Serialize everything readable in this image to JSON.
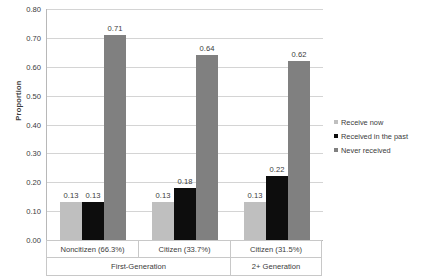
{
  "chart_data": {
    "type": "bar",
    "title": "",
    "xlabel": "",
    "ylabel": "Proportion",
    "ylim": [
      0,
      0.8
    ],
    "ytick_step": 0.1,
    "grid": true,
    "legend_position": "right",
    "categories": [
      "Noncitizen (66.3%)",
      "Citizen (33.7%)",
      "Citizen (31.5%)"
    ],
    "group_headers": [
      {
        "label": "First-Generation",
        "span": 2
      },
      {
        "label": "2+ Generation",
        "span": 1
      }
    ],
    "series": [
      {
        "name": "Receive now",
        "color": "#bfbfbf",
        "values": [
          0.13,
          0.13,
          0.13
        ]
      },
      {
        "name": "Received in the past",
        "color": "#0d0d0d",
        "values": [
          0.13,
          0.18,
          0.22
        ]
      },
      {
        "name": "Never received",
        "color": "#808080",
        "values": [
          0.71,
          0.64,
          0.62
        ]
      }
    ],
    "yticks": [
      "0.00",
      "0.10",
      "0.20",
      "0.30",
      "0.40",
      "0.50",
      "0.60",
      "0.70",
      "0.80"
    ],
    "data_labels": [
      [
        "0.13",
        "0.13",
        "0.71"
      ],
      [
        "0.13",
        "0.18",
        "0.64"
      ],
      [
        "0.13",
        "0.22",
        "0.62"
      ]
    ]
  },
  "axis": {
    "y_title": "Proportion"
  },
  "legend": {
    "items": [
      {
        "label": "Receive now",
        "color": "#bfbfbf"
      },
      {
        "label": "Received in the past",
        "color": "#0d0d0d"
      },
      {
        "label": "Never received",
        "color": "#808080"
      }
    ]
  }
}
